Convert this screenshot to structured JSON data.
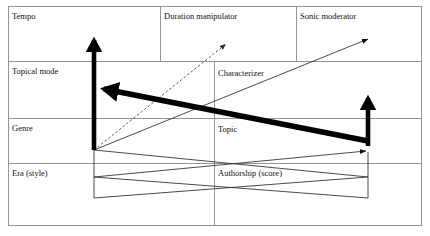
{
  "diagram": {
    "background": "#ffffff",
    "line_color": "#888888",
    "arrow_color": "#000000",
    "dashed_arrow_color": "#555555"
  },
  "table": {
    "columns": 3,
    "rows": 5,
    "column_dividers_px": [
      160,
      296
    ],
    "row_dividers_px": [
      61,
      118,
      163
    ],
    "outer_border": {
      "x": 8,
      "y": 6,
      "width": 414,
      "height": 220
    },
    "cells": [
      {
        "id": "tempo",
        "label": "Tempo",
        "row": 1,
        "col": 1,
        "x": 12,
        "y": 11
      },
      {
        "id": "duration-manipulator",
        "label": "Duration manipulator",
        "row": 1,
        "col": 2,
        "x": 164,
        "y": 11
      },
      {
        "id": "sonic-moderator",
        "label": "Sonic moderator",
        "row": 1,
        "col": 3,
        "x": 300,
        "y": 11
      },
      {
        "id": "topical-mode",
        "label": "Topical mode",
        "row": 2,
        "col": 1,
        "x": 12,
        "y": 66
      },
      {
        "id": "characterizer",
        "label": "Characterizer",
        "row": 2,
        "col": 2,
        "x": 218,
        "y": 70
      },
      {
        "id": "genre",
        "label": "Genre",
        "row": 3,
        "col": 1,
        "x": 12,
        "y": 123
      },
      {
        "id": "topic",
        "label": "Topic",
        "row": 3,
        "col": 2,
        "x": 218,
        "y": 125
      },
      {
        "id": "era-style",
        "label": "Era (style)",
        "row": 4,
        "col": 1,
        "x": 12,
        "y": 168
      },
      {
        "id": "authorship-score",
        "label": "Authorship (score)",
        "row": 4,
        "col": 2,
        "x": 218,
        "y": 168
      }
    ]
  },
  "arrows": [
    {
      "id": "thick-up-left",
      "style": "thick-solid",
      "from": [
        94,
        150
      ],
      "to": [
        94,
        34
      ],
      "stroke": 5,
      "head": "end"
    },
    {
      "id": "thick-left-from-right",
      "style": "thick-solid",
      "from": [
        368,
        141
      ],
      "to": [
        98,
        88
      ],
      "stroke": 6,
      "head": "end"
    },
    {
      "id": "thick-up-right",
      "style": "thick-solid",
      "from": [
        368,
        145
      ],
      "to": [
        368,
        93
      ],
      "stroke": 5,
      "head": "end"
    },
    {
      "id": "dashed-up-right",
      "style": "dashed",
      "from": [
        94,
        150
      ],
      "to": [
        226,
        43
      ],
      "stroke": 1,
      "head": "end"
    },
    {
      "id": "thin-up-right-long",
      "style": "thin-solid",
      "from": [
        94,
        150
      ],
      "to": [
        368,
        38
      ],
      "stroke": 1,
      "head": "end"
    },
    {
      "id": "thin-down-right",
      "style": "thin-solid",
      "from": [
        94,
        150
      ],
      "to": [
        368,
        177
      ],
      "stroke": 1,
      "head": "none"
    },
    {
      "id": "thin-bottom-left",
      "style": "thin-solid",
      "from": [
        94,
        198
      ],
      "to": [
        368,
        177
      ],
      "stroke": 1,
      "head": "none"
    },
    {
      "id": "thin-bottom-right",
      "style": "thin-solid",
      "from": [
        368,
        198
      ],
      "to": [
        94,
        177
      ],
      "stroke": 1,
      "head": "none"
    },
    {
      "id": "thin-to-right-node",
      "style": "thin-solid",
      "from": [
        94,
        177
      ],
      "to": [
        366,
        150
      ],
      "stroke": 1,
      "head": "end"
    },
    {
      "id": "thin-right-vertical",
      "style": "thin-solid",
      "from": [
        368,
        198
      ],
      "to": [
        368,
        150
      ],
      "stroke": 1,
      "head": "none"
    },
    {
      "id": "thin-left-vertical",
      "style": "thin-solid",
      "from": [
        94,
        198
      ],
      "to": [
        94,
        150
      ],
      "stroke": 1,
      "head": "none"
    }
  ]
}
